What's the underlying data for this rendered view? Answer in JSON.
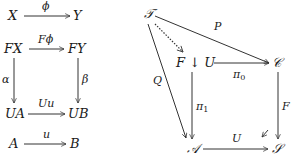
{
  "left_diagram": {
    "top_row": {
      "source": "X",
      "target": "Y",
      "arrow_label": "ϕ"
    },
    "square": {
      "top_left": "FX",
      "top_right": "FY",
      "bottom_left": "UA",
      "bottom_right": "UB",
      "top_arrow_label": "Fϕ",
      "left_arrow_label": "α",
      "right_arrow_label": "β",
      "bottom_arrow_label": "Uu"
    },
    "bottom_row": {
      "source": "A",
      "target": "B",
      "arrow_label": "u"
    }
  },
  "right_diagram": {
    "nodes": {
      "T": "𝒯",
      "comma": "F ↓ U",
      "C": "𝒞",
      "A": "𝒜",
      "S": "𝒮"
    },
    "arrow_labels": {
      "P": "P",
      "Q": "Q",
      "pi0": "π",
      "pi0_sub": "0",
      "pi1": "π",
      "pi1_sub": "1",
      "F": "F",
      "U": "U"
    }
  }
}
